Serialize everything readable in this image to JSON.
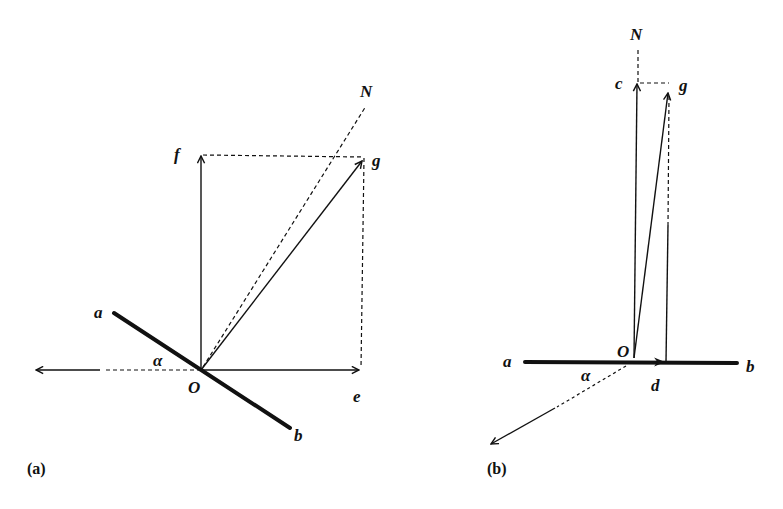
{
  "figure": {
    "panels": [
      {
        "id": "a",
        "caption": "(a)",
        "labels": {
          "N": "N",
          "f": "f",
          "g": "g",
          "a": "a",
          "alpha": "α",
          "O": "O",
          "e": "e",
          "b": "b"
        },
        "description": "Line ab inclined at angle α; vectors Of (vertical) and Oe (horizontal) compose resultant Og; dashed normal ON; leftward arrow along horizontal"
      },
      {
        "id": "b",
        "caption": "(b)",
        "labels": {
          "N": "N",
          "c": "c",
          "g": "g",
          "a": "a",
          "O": "O",
          "alpha": "α",
          "d": "d",
          "b": "b"
        },
        "description": "Horizontal line ab; vertical vector Oc and small horizontal vector Od compose resultant Og; dashed normal N above c; arrow toward lower-left at angle α"
      }
    ]
  }
}
